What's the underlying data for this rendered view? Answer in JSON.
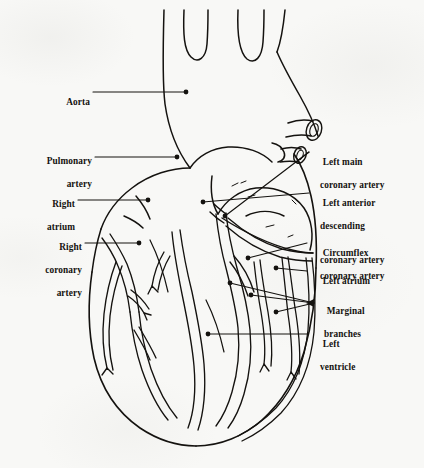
{
  "figure": {
    "background_color": "#f8f8f6",
    "ink_color": "#14120f",
    "width": 424,
    "height": 468
  },
  "labels": {
    "aorta": {
      "text": "Aorta",
      "align": "right"
    },
    "pulmonary_l1": {
      "text": "Pulmonary",
      "align": "right"
    },
    "pulmonary_l2": {
      "text": "artery",
      "align": "right"
    },
    "right_atrium_l1": {
      "text": "Right",
      "align": "right"
    },
    "right_atrium_l2": {
      "text": "atrium",
      "align": "right"
    },
    "rca_l1": {
      "text": "Right",
      "align": "right"
    },
    "rca_l2": {
      "text": "coronary",
      "align": "right"
    },
    "rca_l3": {
      "text": "artery",
      "align": "right"
    },
    "left_main_l1": {
      "text": "Left main",
      "align": "left"
    },
    "left_main_l2": {
      "text": "coronary artery",
      "align": "left"
    },
    "lad_l1": {
      "text": "Left anterior",
      "align": "left"
    },
    "lad_l2": {
      "text": "descending",
      "align": "left"
    },
    "lad_l3": {
      "text": "coronary artery",
      "align": "left"
    },
    "circumflex_l1": {
      "text": "Circumflex",
      "align": "left"
    },
    "circumflex_l2": {
      "text": "coronary artery",
      "align": "left"
    },
    "left_atrium": {
      "text": "Left atrium",
      "align": "left"
    },
    "marginal_l1": {
      "text": "Marginal",
      "align": "left"
    },
    "marginal_l2": {
      "text": "branches",
      "align": "left"
    },
    "left_ventricle_l1": {
      "text": "Left",
      "align": "left"
    },
    "left_ventricle_l2": {
      "text": "ventricle",
      "align": "left"
    }
  },
  "structures": [
    {
      "name": "aorta",
      "side": "left"
    },
    {
      "name": "pulmonary-artery",
      "side": "left"
    },
    {
      "name": "right-atrium",
      "side": "left"
    },
    {
      "name": "right-coronary-artery",
      "side": "left"
    },
    {
      "name": "left-main-coronary-artery",
      "side": "right"
    },
    {
      "name": "left-anterior-descending-artery",
      "side": "right"
    },
    {
      "name": "circumflex-coronary-artery",
      "side": "right"
    },
    {
      "name": "left-atrium",
      "side": "right"
    },
    {
      "name": "marginal-branches",
      "side": "right"
    },
    {
      "name": "left-ventricle",
      "side": "right"
    }
  ]
}
